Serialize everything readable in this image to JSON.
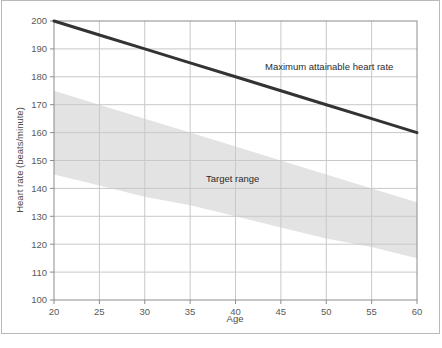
{
  "chart_data": {
    "type": "line",
    "title": "",
    "xlabel": "Age",
    "ylabel": "Heart rate (beats/minute)",
    "xlim": [
      20,
      60
    ],
    "ylim": [
      100,
      200
    ],
    "xticks": [
      20,
      25,
      30,
      35,
      40,
      45,
      50,
      55,
      60
    ],
    "yticks": [
      100,
      110,
      120,
      130,
      140,
      150,
      160,
      170,
      180,
      190,
      200
    ],
    "grid": true,
    "legend_position": "none",
    "series": [
      {
        "name": "Maximum attainable heart rate",
        "type": "line",
        "color": "#333333",
        "linewidth": 3,
        "x": [
          20,
          25,
          30,
          35,
          40,
          45,
          50,
          55,
          60
        ],
        "values": [
          200,
          195,
          190,
          185,
          180,
          175,
          170,
          165,
          160
        ]
      },
      {
        "name": "Target range",
        "type": "band",
        "color": "#e3e3e3",
        "x": [
          20,
          25,
          30,
          35,
          40,
          45,
          50,
          55,
          60
        ],
        "upper": [
          175,
          170,
          165,
          160,
          155,
          150,
          145,
          140,
          135
        ],
        "lower": [
          145,
          141,
          137,
          134,
          130,
          126,
          122,
          119,
          115
        ]
      }
    ],
    "annotations": [
      {
        "text": "Maximum attainable heart rate",
        "x": 46.5,
        "y": 184.5
      },
      {
        "text": "Target range",
        "x": 37.5,
        "y": 136.5
      }
    ]
  },
  "axes": {
    "x_title": "Age",
    "y_title": "Heart rate (beats/minute)",
    "x_tick_labels": [
      "20",
      "25",
      "30",
      "35",
      "40",
      "45",
      "50",
      "55",
      "60"
    ],
    "y_tick_labels": [
      "100",
      "110",
      "120",
      "130",
      "140",
      "150",
      "160",
      "170",
      "180",
      "190",
      "200"
    ]
  },
  "annotations": {
    "max_hr_label": "Maximum attainable heart rate",
    "target_range_label": "Target range"
  },
  "colors": {
    "line": "#333333",
    "band": "#e3e3e3",
    "grid": "#c8c8c8",
    "axis": "#8c8c8c",
    "frame": "#b9b9b9",
    "text": "#5a5a5a",
    "background": "#ffffff"
  }
}
